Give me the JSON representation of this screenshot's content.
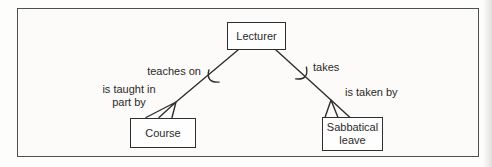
{
  "diagram": {
    "nodes": {
      "lecturer": {
        "label": "Lecturer"
      },
      "course": {
        "label": "Course"
      },
      "sabbatical": {
        "label_line1": "Sabbatical",
        "label_line2": "leave"
      }
    },
    "relationships": {
      "left": {
        "label_at_lecturer_end": "teaches on",
        "label_at_course_end_line1": "is taught in",
        "label_at_course_end_line2": "part by"
      },
      "right": {
        "label_at_lecturer_end": "takes",
        "label_at_sabbatical_end": "is taken by"
      }
    },
    "colors": {
      "line": "#2e2e2e",
      "box_border": "#2e2e2e",
      "box_fill": "#fefefe",
      "frame_border": "#4f4f4f",
      "frame_fill": "#fcfbf9",
      "page_bg": "#fdfdfc",
      "text": "#2a2a2a"
    }
  }
}
